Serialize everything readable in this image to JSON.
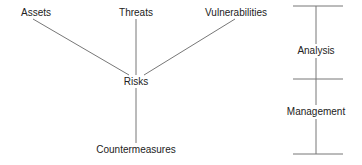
{
  "diagram": {
    "hub": {
      "label": "Risks",
      "x": 136,
      "y": 82
    },
    "inputs": [
      {
        "label": "Assets",
        "x": 36,
        "y": 13
      },
      {
        "label": "Threats",
        "x": 136,
        "y": 13
      },
      {
        "label": "Vulnerabilities",
        "x": 236,
        "y": 13
      }
    ],
    "output": {
      "label": "Countermeasures",
      "x": 136,
      "y": 150
    },
    "phases": [
      {
        "label": "Analysis",
        "x": 316,
        "y": 51
      },
      {
        "label": "Management",
        "x": 316,
        "y": 112
      }
    ],
    "line_color": "#777777"
  }
}
